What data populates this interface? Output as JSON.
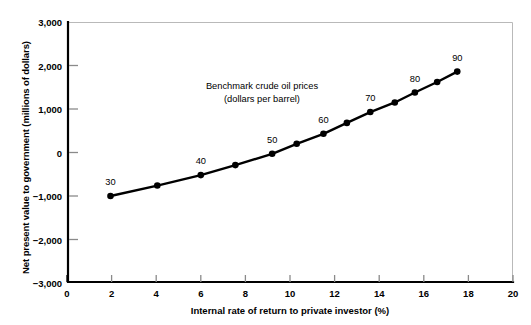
{
  "chart_data": {
    "type": "line",
    "title": "",
    "xlabel": "Internal rate of return to private investor (%)",
    "ylabel": "Net present value to government (millions of dollars)",
    "xlim": [
      0,
      20
    ],
    "ylim": [
      -3000,
      3000
    ],
    "xticks": [
      "0",
      "2",
      "4",
      "6",
      "8",
      "10",
      "12",
      "14",
      "16",
      "18",
      "20"
    ],
    "xtick_values": [
      0,
      2,
      4,
      6,
      8,
      10,
      12,
      14,
      16,
      18,
      20
    ],
    "yticks": [
      "3,000",
      "2,000",
      "1,000",
      "0",
      "−1,000",
      "−2,000",
      "−3,000"
    ],
    "ytick_values": [
      3000,
      2000,
      1000,
      0,
      -1000,
      -2000,
      -3000
    ],
    "grid": false,
    "legend": null,
    "annotations": [
      {
        "text_line1": "Benchmark crude oil prices",
        "text_line2": "(dollars per barrel)",
        "x": 8.6,
        "y": 1450
      }
    ],
    "series": [
      {
        "name": "Net present value to government",
        "marker": "circle",
        "color": "#000000",
        "x": [
          1.95,
          4.05,
          6.0,
          7.55,
          9.2,
          10.3,
          11.5,
          12.55,
          13.6,
          14.7,
          15.6,
          16.6,
          17.5
        ],
        "y": [
          -1000,
          -760,
          -520,
          -290,
          -30,
          200,
          430,
          680,
          930,
          1150,
          1380,
          1620,
          1860
        ],
        "point_labels": [
          {
            "index": 0,
            "label": "30"
          },
          {
            "index": 2,
            "label": "40"
          },
          {
            "index": 4,
            "label": "50"
          },
          {
            "index": 6,
            "label": "60"
          },
          {
            "index": 8,
            "label": "70"
          },
          {
            "index": 10,
            "label": "80"
          },
          {
            "index": 12,
            "label": "90"
          }
        ]
      }
    ]
  },
  "figure": {
    "plot_area": {
      "left": 67,
      "top": 22,
      "right": 513,
      "bottom": 283
    },
    "axis_color": "#000000",
    "frame_light_color": "#b9b9b9",
    "tick_color": "#8a8a8a",
    "background": "#ffffff"
  }
}
